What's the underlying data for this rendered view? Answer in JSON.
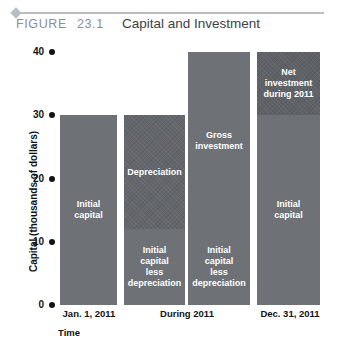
{
  "figure": {
    "label": "FIGURE",
    "number": "23.1",
    "title": "Capital and Investment"
  },
  "chart_data": {
    "type": "bar",
    "title": "Capital and Investment",
    "xlabel": "Time",
    "ylabel": "Capital (thousands of dollars)",
    "ylim": [
      0,
      40
    ],
    "yticks": [
      "0",
      "10",
      "20",
      "30",
      "40"
    ],
    "ytick_values": [
      0,
      10,
      20,
      30,
      40
    ],
    "grid": false,
    "legend": "none",
    "categories": [
      "Jan. 1, 2011",
      "During 2011",
      "Dec. 31, 2011"
    ],
    "bars": [
      {
        "name": "initial-capital-bar",
        "category": "Jan. 1, 2011",
        "total": 30,
        "segments": [
          {
            "name": "initial-capital",
            "label": "Initial\ncapital",
            "from": 0,
            "to": 30,
            "value": 30,
            "fill": "plain"
          }
        ]
      },
      {
        "name": "depreciation-bar",
        "category": "During 2011",
        "total": 30,
        "segments": [
          {
            "name": "depreciation",
            "label": "Depreciation",
            "from": 12,
            "to": 30,
            "value": 18,
            "fill": "textured"
          },
          {
            "name": "initial-capital-less-depreciation",
            "label": "Initial\ncapital\nless\ndepreciation",
            "from": 0,
            "to": 12,
            "value": 12,
            "fill": "plain"
          }
        ]
      },
      {
        "name": "gross-investment-bar",
        "category": "During 2011",
        "total": 40,
        "segments": [
          {
            "name": "gross-investment",
            "label": "Gross\ninvestment",
            "from": 12,
            "to": 40,
            "value": 28,
            "fill": "plain"
          },
          {
            "name": "initial-capital-less-depreciation",
            "label": "Initial\ncapital\nless\ndepreciation",
            "from": 0,
            "to": 12,
            "value": 12,
            "fill": "plain"
          }
        ]
      },
      {
        "name": "net-investment-bar",
        "category": "Dec. 31, 2011",
        "total": 40,
        "segments": [
          {
            "name": "net-investment-during-2011",
            "label": "Net\ninvestment\nduring 2011",
            "from": 30,
            "to": 40,
            "value": 10,
            "fill": "dark"
          },
          {
            "name": "initial-capital",
            "label": "Initial\ncapital",
            "from": 0,
            "to": 30,
            "value": 30,
            "fill": "plain"
          }
        ]
      }
    ]
  },
  "colors": {
    "bar_plain": "#6e7176",
    "bar_textured": "#63666b",
    "bar_dark": "#5e6166",
    "rule": "#b9bec4",
    "heading_gray": "#8a8f96",
    "title_text": "#3c4148",
    "axis_text": "#111316"
  }
}
